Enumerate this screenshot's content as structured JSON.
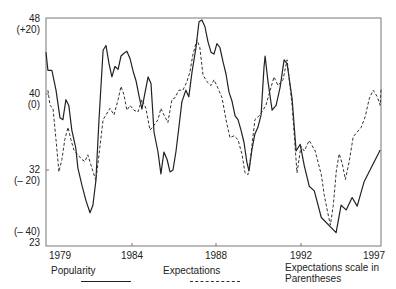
{
  "chart_data": {
    "type": "line",
    "title": "",
    "xlabel": "",
    "ylabel": "",
    "xlim": [
      1979.93,
      1995.79
    ],
    "ylim": [
      24,
      48
    ],
    "grid": false,
    "legend_position": "bottom",
    "x_ticks": [
      {
        "label": "1979",
        "px": 60
      },
      {
        "label": "1984",
        "px": 132
      },
      {
        "label": "1988",
        "px": 216
      },
      {
        "label": "1992",
        "px": 301
      },
      {
        "label": "1997",
        "px": 374
      }
    ],
    "y_ticks": [
      {
        "label": "48",
        "sub": "(+20)",
        "value": 48
      },
      {
        "label": "40",
        "sub": "(0)",
        "value": 40
      },
      {
        "label": "32",
        "sub": "(– 20)",
        "value": 32
      },
      {
        "label": "23",
        "sub": "(– 40)",
        "value": 23
      }
    ],
    "secondary_axis_note": "Expectations scale in Parentheses",
    "series": [
      {
        "name": "Popularity",
        "style": "solid",
        "points": [
          [
            1979.93,
            44.4
          ],
          [
            1980.02,
            42.5
          ],
          [
            1980.21,
            42.5
          ],
          [
            1980.4,
            40.4
          ],
          [
            1980.59,
            37.5
          ],
          [
            1980.73,
            37.3
          ],
          [
            1980.87,
            39.4
          ],
          [
            1981.01,
            38.8
          ],
          [
            1981.15,
            36.2
          ],
          [
            1981.34,
            34.3
          ],
          [
            1981.44,
            32.2
          ],
          [
            1981.63,
            30.4
          ],
          [
            1981.82,
            28.8
          ],
          [
            1982.01,
            27.5
          ],
          [
            1982.15,
            28.3
          ],
          [
            1982.29,
            30.9
          ],
          [
            1982.44,
            37.3
          ],
          [
            1982.63,
            44.6
          ],
          [
            1982.77,
            45.1
          ],
          [
            1982.91,
            43.2
          ],
          [
            1983.05,
            41.8
          ],
          [
            1983.19,
            42.9
          ],
          [
            1983.34,
            42.6
          ],
          [
            1983.48,
            44.0
          ],
          [
            1983.62,
            44.3
          ],
          [
            1983.76,
            44.5
          ],
          [
            1983.91,
            43.7
          ],
          [
            1984.05,
            42.4
          ],
          [
            1984.19,
            41.4
          ],
          [
            1984.33,
            39.8
          ],
          [
            1984.47,
            38.4
          ],
          [
            1984.62,
            40.2
          ],
          [
            1984.76,
            41.8
          ],
          [
            1984.9,
            41.1
          ],
          [
            1985.04,
            36.0
          ],
          [
            1985.23,
            33.9
          ],
          [
            1985.37,
            31.6
          ],
          [
            1985.51,
            33.9
          ],
          [
            1985.66,
            33.1
          ],
          [
            1985.8,
            31.8
          ],
          [
            1985.94,
            32.0
          ],
          [
            1986.08,
            33.9
          ],
          [
            1986.22,
            36.5
          ],
          [
            1986.36,
            39.2
          ],
          [
            1986.55,
            40.4
          ],
          [
            1986.69,
            39.7
          ],
          [
            1986.84,
            42.3
          ],
          [
            1987.03,
            44.9
          ],
          [
            1987.17,
            47.6
          ],
          [
            1987.31,
            47.8
          ],
          [
            1987.45,
            47.1
          ],
          [
            1987.6,
            45.5
          ],
          [
            1987.74,
            44.4
          ],
          [
            1987.88,
            44.2
          ],
          [
            1988.02,
            45.3
          ],
          [
            1988.16,
            44.9
          ],
          [
            1988.31,
            43.4
          ],
          [
            1988.45,
            42.1
          ],
          [
            1988.59,
            40.2
          ],
          [
            1988.73,
            39.3
          ],
          [
            1388.88,
            37.7
          ],
          [
            1989.02,
            37.3
          ],
          [
            1989.16,
            36.2
          ],
          [
            1989.3,
            34.9
          ],
          [
            1989.44,
            32.8
          ],
          [
            1989.54,
            31.9
          ],
          [
            1989.68,
            34.2
          ],
          [
            1989.82,
            35.8
          ],
          [
            1989.96,
            36.5
          ],
          [
            1990.11,
            37.8
          ],
          [
            1990.25,
            42.8
          ],
          [
            1990.3,
            44.0
          ],
          [
            1990.44,
            41.3
          ],
          [
            1990.63,
            38.3
          ],
          [
            1990.82,
            38.8
          ],
          [
            1991.01,
            40.7
          ],
          [
            1991.2,
            43.6
          ],
          [
            1991.34,
            43.2
          ],
          [
            1991.58,
            39.5
          ],
          [
            1991.77,
            34.0
          ],
          [
            1991.96,
            34.7
          ],
          [
            1992.15,
            32.5
          ],
          [
            1992.39,
            30.3
          ],
          [
            1992.63,
            29.8
          ],
          [
            1992.96,
            27.0
          ],
          [
            1993.66,
            25.4
          ],
          [
            1993.9,
            28.3
          ],
          [
            1994.14,
            27.8
          ],
          [
            1994.42,
            29.1
          ],
          [
            1994.66,
            28.2
          ],
          [
            1994.99,
            30.8
          ],
          [
            1995.75,
            34.1
          ]
        ]
      },
      {
        "name": "Expectations",
        "style": "dashed",
        "points": [
          [
            1980.02,
            40.4
          ],
          [
            1980.12,
            38.8
          ],
          [
            1980.26,
            38.5
          ],
          [
            1980.4,
            35.2
          ],
          [
            1980.54,
            31.8
          ],
          [
            1980.68,
            33.1
          ],
          [
            1980.82,
            35.2
          ],
          [
            1980.97,
            36.5
          ],
          [
            1981.11,
            35.2
          ],
          [
            1981.25,
            34.1
          ],
          [
            1981.44,
            33.6
          ],
          [
            1981.63,
            33.1
          ],
          [
            1981.77,
            32.9
          ],
          [
            1981.91,
            33.6
          ],
          [
            1982.1,
            32.2
          ],
          [
            1982.29,
            30.9
          ],
          [
            1982.44,
            33.6
          ],
          [
            1982.63,
            37.3
          ],
          [
            1982.77,
            37.8
          ],
          [
            1982.96,
            38.5
          ],
          [
            1983.15,
            37.8
          ],
          [
            1983.34,
            39.4
          ],
          [
            1983.48,
            40.8
          ],
          [
            1983.62,
            39.9
          ],
          [
            1983.76,
            38.3
          ],
          [
            1983.91,
            38.8
          ],
          [
            1984.09,
            38.3
          ],
          [
            1984.28,
            38.1
          ],
          [
            1984.47,
            39.4
          ],
          [
            1984.66,
            38.5
          ],
          [
            1984.85,
            36.2
          ],
          [
            1985.04,
            36.7
          ],
          [
            1985.23,
            37.3
          ],
          [
            1985.37,
            38.5
          ],
          [
            1985.51,
            37.8
          ],
          [
            1985.7,
            37.0
          ],
          [
            1985.89,
            39.4
          ],
          [
            1986.03,
            39.6
          ],
          [
            1986.22,
            40.4
          ],
          [
            1986.41,
            40.4
          ],
          [
            1986.6,
            41.3
          ],
          [
            1986.74,
            42.3
          ],
          [
            1986.88,
            44.1
          ],
          [
            1987.07,
            45.7
          ],
          [
            1987.21,
            44.9
          ],
          [
            1987.36,
            42.0
          ],
          [
            1987.55,
            41.3
          ],
          [
            1987.74,
            40.9
          ],
          [
            1987.88,
            41.5
          ],
          [
            1988.07,
            40.6
          ],
          [
            1988.26,
            39.6
          ],
          [
            1988.45,
            37.3
          ],
          [
            1988.64,
            35.4
          ],
          [
            1988.83,
            35.6
          ],
          [
            1989.02,
            35.2
          ],
          [
            1989.21,
            33.6
          ],
          [
            1989.35,
            31.7
          ],
          [
            1989.49,
            31.5
          ],
          [
            1989.63,
            33.6
          ],
          [
            1989.82,
            37.3
          ],
          [
            1990.06,
            37.8
          ],
          [
            1990.34,
            38.8
          ],
          [
            1990.72,
            41.8
          ],
          [
            1990.91,
            40.9
          ],
          [
            1991.15,
            41.5
          ],
          [
            1991.34,
            43.6
          ],
          [
            1991.58,
            38.8
          ],
          [
            1991.81,
            31.7
          ],
          [
            1992.0,
            34.5
          ],
          [
            1992.15,
            34.0
          ],
          [
            1992.39,
            35.1
          ],
          [
            1992.67,
            34.0
          ],
          [
            1992.96,
            31.5
          ],
          [
            1993.1,
            29.4
          ],
          [
            1993.24,
            27.8
          ],
          [
            1993.39,
            26.2
          ],
          [
            1993.53,
            28.3
          ],
          [
            1993.67,
            31.9
          ],
          [
            1993.81,
            33.7
          ],
          [
            1993.96,
            32.6
          ],
          [
            1994.1,
            31.0
          ],
          [
            1994.28,
            32.9
          ],
          [
            1994.47,
            35.5
          ],
          [
            1994.66,
            36.0
          ],
          [
            1994.85,
            36.5
          ],
          [
            1995.04,
            37.6
          ],
          [
            1995.23,
            39.5
          ],
          [
            1995.42,
            40.4
          ],
          [
            1995.61,
            39.7
          ],
          [
            1995.75,
            38.8
          ],
          [
            1995.79,
            40.6
          ]
        ]
      }
    ]
  },
  "legend": {
    "popularity_label": "Popularity",
    "expectations_label": "Expectations",
    "note_line1": "Expectations scale in",
    "note_line2": "Parentheses"
  }
}
